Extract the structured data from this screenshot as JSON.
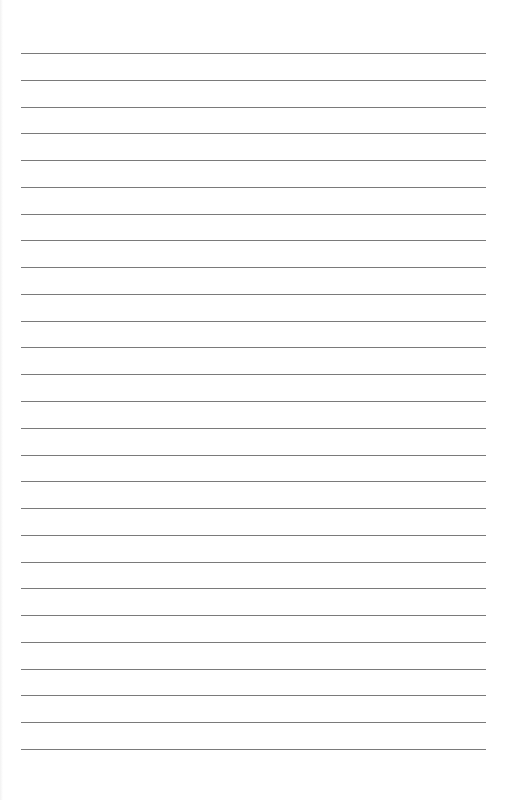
{
  "page": {
    "type": "lined-paper",
    "title": "",
    "line_count": 27,
    "first_line_y": 53,
    "line_spacing": 26.77,
    "line_left": 21,
    "line_width": 465,
    "colors": {
      "background": "#ffffff",
      "rule": "#7a7a7a"
    }
  }
}
